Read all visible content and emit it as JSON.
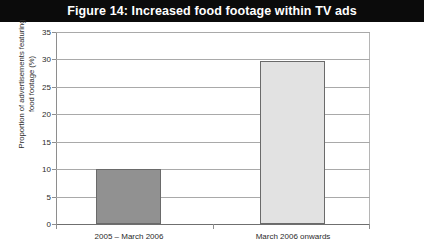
{
  "figure": {
    "title": "Figure 14: Increased food footage within TV ads",
    "title_bar_color": "#0b0b0b",
    "title_text_color": "#ffffff"
  },
  "chart_data": {
    "type": "bar",
    "title": "Figure 14: Increased food footage within TV ads",
    "categories": [
      "2005 – March 2006",
      "March 2006 onwards"
    ],
    "values": [
      10,
      29.7
    ],
    "series": [
      {
        "name": "Proportion of advertisements featuring food footage",
        "values": [
          10,
          29.7
        ]
      }
    ],
    "xlabel": "",
    "ylabel": "Proportion of advertisements featuring food footage (%)",
    "ylabel_line1": "Proportion of advertisements featuring",
    "ylabel_line2": "food footage (%)",
    "ylim": [
      0,
      35
    ],
    "ytick_step": 5,
    "yticks": [
      0,
      5,
      10,
      15,
      20,
      25,
      30,
      35
    ],
    "ytick_labels": [
      "0",
      "5",
      "10",
      "15",
      "20",
      "25",
      "30",
      "35"
    ],
    "grid": true,
    "grid_axis": "y",
    "legend": false,
    "legend_position": "none",
    "bar_colors": [
      "#919191",
      "#e2e2e2"
    ],
    "bar_edge_color": "#6a6a6a",
    "gridline_color": "#a9a9a9",
    "axis_color": "#6f6f6f",
    "background": "#ffffff"
  }
}
